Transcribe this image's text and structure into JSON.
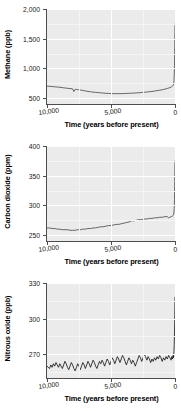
{
  "figure": {
    "shared_xlabel": "Time (years before present)",
    "x_ticks": [
      "10,000",
      "5,000",
      "0"
    ],
    "x_tick_values": [
      10000,
      5000,
      0
    ]
  },
  "chart_data": [
    {
      "type": "line",
      "title": "",
      "ylabel": "Methane (ppb)",
      "xlabel": "Time (years before present)",
      "xlim": [
        10000,
        0
      ],
      "ylim": [
        400,
        2000
      ],
      "x_ticks": [
        10000,
        5000,
        0
      ],
      "x_tick_labels": [
        "10,000",
        "5,000",
        "0"
      ],
      "y_ticks": [
        500,
        1000,
        1500,
        2000
      ],
      "y_tick_labels": [
        "500",
        "1,000",
        "1,500",
        "2,000"
      ],
      "grid": true,
      "legend": "none",
      "line_color": "#4d4d4d",
      "x": [
        10000,
        9800,
        9600,
        9400,
        9200,
        9000,
        8800,
        8600,
        8400,
        8200,
        8000,
        7900,
        7800,
        7600,
        7400,
        7200,
        7000,
        6800,
        6600,
        6400,
        6200,
        6000,
        5800,
        5600,
        5400,
        5200,
        5000,
        4800,
        4600,
        4400,
        4200,
        4000,
        3800,
        3600,
        3400,
        3200,
        3000,
        2800,
        2600,
        2400,
        2200,
        2000,
        1800,
        1600,
        1400,
        1200,
        1000,
        800,
        600,
        400,
        300,
        200,
        150,
        100,
        80,
        60,
        40,
        20,
        10,
        0
      ],
      "y": [
        700,
        698,
        694,
        690,
        686,
        682,
        676,
        670,
        665,
        660,
        655,
        610,
        648,
        642,
        636,
        628,
        620,
        612,
        606,
        600,
        596,
        592,
        588,
        584,
        580,
        578,
        576,
        575,
        574,
        574,
        575,
        576,
        578,
        580,
        582,
        584,
        587,
        590,
        594,
        598,
        602,
        606,
        612,
        618,
        625,
        632,
        640,
        650,
        662,
        676,
        686,
        700,
        715,
        740,
        790,
        880,
        1050,
        1350,
        1600,
        1745
      ]
    },
    {
      "type": "line",
      "title": "",
      "ylabel": "Carbon dioxide (ppm)",
      "xlabel": "Time (years before present)",
      "xlim": [
        10000,
        0
      ],
      "ylim": [
        240,
        400
      ],
      "x_ticks": [
        10000,
        5000,
        0
      ],
      "x_tick_labels": [
        "10,000",
        "5,000",
        "0"
      ],
      "y_ticks": [
        250,
        300,
        350,
        400
      ],
      "y_tick_labels": [
        "250",
        "300",
        "350",
        "400"
      ],
      "grid": true,
      "legend": "none",
      "line_color": "#4d4d4d",
      "x": [
        10000,
        9800,
        9600,
        9400,
        9200,
        9000,
        8800,
        8600,
        8400,
        8200,
        8000,
        7800,
        7600,
        7400,
        7200,
        7000,
        6800,
        6600,
        6400,
        6200,
        6000,
        5800,
        5600,
        5400,
        5200,
        5000,
        4800,
        4600,
        4400,
        4200,
        4000,
        3800,
        3600,
        3400,
        3200,
        3000,
        2800,
        2600,
        2400,
        2200,
        2000,
        1800,
        1600,
        1400,
        1200,
        1000,
        800,
        600,
        500,
        400,
        300,
        200,
        150,
        100,
        60,
        40,
        20,
        10,
        0
      ],
      "y": [
        262,
        262,
        261,
        261,
        260,
        260,
        259,
        259,
        259,
        258,
        258,
        258,
        259,
        259,
        260,
        260,
        261,
        261,
        262,
        262,
        263,
        264,
        264,
        265,
        266,
        266,
        267,
        268,
        268,
        269,
        270,
        271,
        272,
        274,
        274,
        275,
        276,
        276,
        277,
        277,
        278,
        278,
        279,
        279,
        280,
        280,
        281,
        281,
        279,
        280,
        281,
        282,
        283,
        285,
        295,
        310,
        340,
        360,
        375
      ]
    },
    {
      "type": "line",
      "title": "",
      "ylabel": "Nitrous oxide (ppb)",
      "xlabel": "Time (years before present)",
      "xlim": [
        10000,
        0
      ],
      "ylim": [
        250,
        330
      ],
      "x_ticks": [
        10000,
        5000,
        0
      ],
      "x_tick_labels": [
        "10,000",
        "5,000",
        "0"
      ],
      "y_ticks": [
        270,
        300,
        330
      ],
      "y_tick_labels": [
        "270",
        "300",
        "330"
      ],
      "grid": true,
      "legend": "none",
      "line_color": "#1a1a1a",
      "x": [
        10000,
        9900,
        9800,
        9700,
        9600,
        9500,
        9400,
        9300,
        9200,
        9100,
        9000,
        8900,
        8800,
        8700,
        8600,
        8500,
        8400,
        8300,
        8200,
        8100,
        8000,
        7900,
        7800,
        7700,
        7600,
        7500,
        7400,
        7300,
        7200,
        7100,
        7000,
        6900,
        6800,
        6700,
        6600,
        6500,
        6400,
        6300,
        6200,
        6100,
        6000,
        5900,
        5800,
        5700,
        5600,
        5500,
        5400,
        5300,
        5200,
        5100,
        5000,
        4900,
        4800,
        4700,
        4600,
        4500,
        4400,
        4300,
        4200,
        4100,
        4000,
        3900,
        3800,
        3700,
        3600,
        3500,
        3400,
        3300,
        3200,
        3100,
        3000,
        2900,
        2800,
        2700,
        2600,
        2500,
        2400,
        2300,
        2200,
        2100,
        2000,
        1900,
        1800,
        1700,
        1600,
        1500,
        1400,
        1300,
        1200,
        1100,
        1000,
        900,
        800,
        700,
        600,
        500,
        400,
        300,
        250,
        200,
        150,
        120,
        100,
        80,
        60,
        40,
        20,
        10,
        0
      ],
      "y": [
        260,
        259,
        258,
        261,
        259,
        262,
        260,
        263,
        261,
        259,
        262,
        260,
        258,
        261,
        264,
        262,
        259,
        257,
        260,
        263,
        261,
        258,
        256,
        259,
        262,
        260,
        257,
        260,
        263,
        261,
        258,
        261,
        264,
        262,
        259,
        262,
        265,
        263,
        260,
        258,
        261,
        264,
        262,
        265,
        263,
        260,
        263,
        266,
        264,
        261,
        264,
        267,
        265,
        262,
        265,
        268,
        266,
        263,
        266,
        269,
        267,
        264,
        261,
        264,
        267,
        265,
        262,
        265,
        263,
        260,
        263,
        266,
        269,
        267,
        264,
        267,
        270,
        268,
        265,
        268,
        266,
        263,
        266,
        264,
        267,
        265,
        268,
        266,
        269,
        267,
        264,
        267,
        265,
        268,
        266,
        269,
        267,
        265,
        268,
        266,
        269,
        267,
        270,
        272,
        278,
        288,
        300,
        310,
        318
      ]
    }
  ]
}
